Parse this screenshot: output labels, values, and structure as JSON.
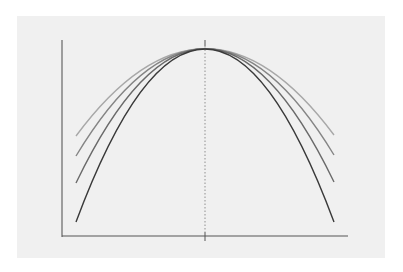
{
  "figure": {
    "background_color": "#f0f0f0",
    "axis_color": "#555555",
    "axes": {
      "y_axis": {
        "x": 62,
        "y_top": 40,
        "y_bottom": 237
      },
      "x_axis": {
        "y": 236,
        "x_left": 62,
        "x_right": 348
      }
    },
    "peak": {
      "x": 205,
      "y": 49
    },
    "center_line": {
      "x": 205,
      "y_top": 40,
      "y_bottom": 241,
      "style": "dotted"
    },
    "curves": [
      {
        "name": "curve-1-widest",
        "color": "#a8a8a8",
        "left": [
          76,
          136
        ],
        "right": [
          334,
          135
        ],
        "control_y": -38
      },
      {
        "name": "curve-2",
        "color": "#858585",
        "left": [
          76,
          156
        ],
        "right": [
          334,
          155
        ],
        "control_y": -58
      },
      {
        "name": "curve-3",
        "color": "#6a6a6a",
        "left": [
          76,
          183
        ],
        "right": [
          334,
          182
        ],
        "control_y": -85
      },
      {
        "name": "curve-4-narrowest",
        "color": "#3a3a3a",
        "left": [
          76,
          222
        ],
        "right": [
          334,
          222
        ],
        "control_y": -124
      }
    ]
  }
}
